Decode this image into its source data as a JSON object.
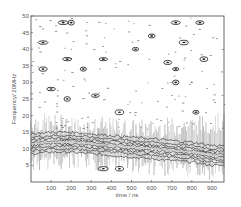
{
  "chart_data": {
    "type": "heatmap",
    "subtype": "time-frequency contour plot",
    "title": "",
    "xlabel": "time / ns",
    "ylabel": "Frequency/ 20MHz",
    "xlim": [
      0,
      960
    ],
    "ylim": [
      0,
      50
    ],
    "xticks": [
      100,
      200,
      300,
      400,
      500,
      600,
      700,
      800,
      900
    ],
    "yticks": [
      5,
      10,
      15,
      20,
      25,
      30,
      35,
      40,
      45,
      50
    ],
    "grid": false,
    "legend": null,
    "colormap": "grayscale contour lines",
    "dominant_band": {
      "description": "strong horizontal energy ridge drifting slightly downward over time",
      "x": [
        0,
        100,
        200,
        300,
        400,
        500,
        600,
        700,
        800,
        900,
        960
      ],
      "center_freq": [
        11.5,
        12,
        12,
        11.5,
        11,
        10.5,
        10,
        9.5,
        9,
        8,
        8
      ],
      "upper_edge": [
        15,
        14.5,
        14,
        13.5,
        13.5,
        13,
        13,
        13.5,
        14,
        14.5,
        15
      ],
      "lower_edge": [
        9,
        9.5,
        9.5,
        9,
        9,
        8.5,
        8,
        7.5,
        7,
        6.5,
        6.5
      ]
    },
    "scattered_blobs": [
      {
        "x": 160,
        "y": 48
      },
      {
        "x": 200,
        "y": 48
      },
      {
        "x": 60,
        "y": 42
      },
      {
        "x": 180,
        "y": 37
      },
      {
        "x": 360,
        "y": 37
      },
      {
        "x": 60,
        "y": 34
      },
      {
        "x": 260,
        "y": 34
      },
      {
        "x": 100,
        "y": 28
      },
      {
        "x": 320,
        "y": 26
      },
      {
        "x": 180,
        "y": 25
      },
      {
        "x": 440,
        "y": 21
      },
      {
        "x": 520,
        "y": 40
      },
      {
        "x": 600,
        "y": 44
      },
      {
        "x": 720,
        "y": 48
      },
      {
        "x": 840,
        "y": 48
      },
      {
        "x": 760,
        "y": 42
      },
      {
        "x": 860,
        "y": 37
      },
      {
        "x": 680,
        "y": 36
      },
      {
        "x": 720,
        "y": 34
      },
      {
        "x": 720,
        "y": 30
      },
      {
        "x": 820,
        "y": 21
      },
      {
        "x": 440,
        "y": 4
      },
      {
        "x": 360,
        "y": 4
      }
    ]
  }
}
